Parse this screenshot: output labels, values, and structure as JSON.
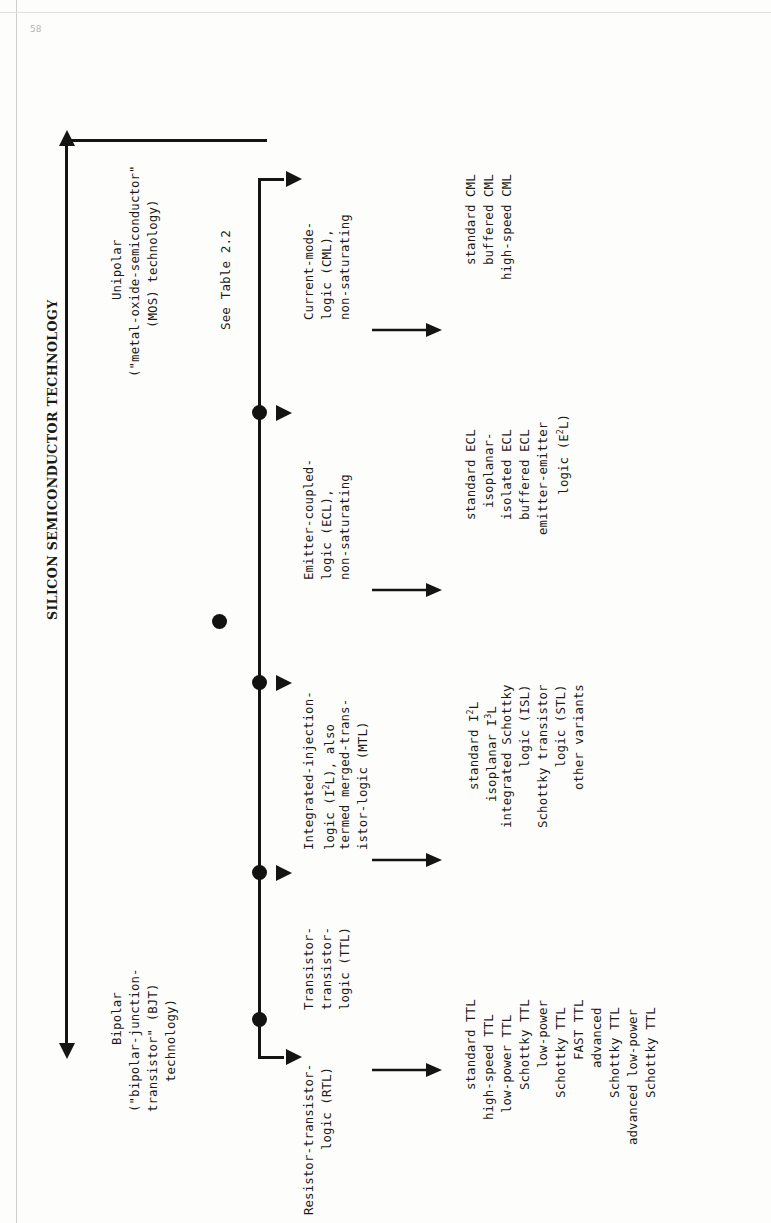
{
  "figure": {
    "title": "SILICON SEMICONDUCTOR TECHNOLOGY",
    "orientation": "rotated-90-ccw",
    "note": "See Table 2.2",
    "corner_mark": "58"
  },
  "top_branches": {
    "bipolar": {
      "line1": "Bipolar",
      "line2": "(\"bipolar-junction-",
      "line3": "transistor\" (BJT)",
      "line4": "technology)"
    },
    "unipolar": {
      "line1": "Unipolar",
      "line2": "(\"metal-oxide-semiconductor\"",
      "line3": "(MOS) technology)"
    }
  },
  "families": [
    {
      "id": "rtl",
      "header": [
        "Resistor-transistor-",
        "logic (RTL)"
      ],
      "children": []
    },
    {
      "id": "ttl",
      "header": [
        "Transistor-",
        "transistor-",
        "logic (TTL)"
      ],
      "children": [
        "standard TTL",
        "high-speed TTL",
        "low-power TTL",
        "Schottky TTL",
        "low-power",
        "  Schottky TTL",
        "FAST TTL",
        "advanced",
        "  Schottky TTL",
        "advanced low-power",
        "  Schottky TTL"
      ]
    },
    {
      "id": "i2l",
      "header": [
        "Integrated-injection-",
        "logic (I2L), also",
        "termed merged-trans-",
        "istor-logic (MTL)"
      ],
      "children": [
        "standard I2L",
        "isoplanar I3L",
        "integrated Schottky",
        "        logic (ISL)",
        "Schottky transistor",
        "        logic (STL)",
        "other variants"
      ]
    },
    {
      "id": "ecl",
      "header": [
        "Emitter-coupled-",
        "logic (ECL),",
        "non-saturating"
      ],
      "children": [
        "standard ECL",
        "isoplanar-",
        "isolated ECL",
        "buffered ECL",
        "emitter-emitter",
        "      logic (E2L)"
      ]
    },
    {
      "id": "cml",
      "header": [
        "Current-mode-",
        "logic (CML),",
        "non-saturating"
      ],
      "children": [
        "standard CML",
        "buffered CML",
        "high-speed CML"
      ]
    }
  ],
  "colors": {
    "ink": "#141412",
    "paper": "#fdfdfb"
  }
}
